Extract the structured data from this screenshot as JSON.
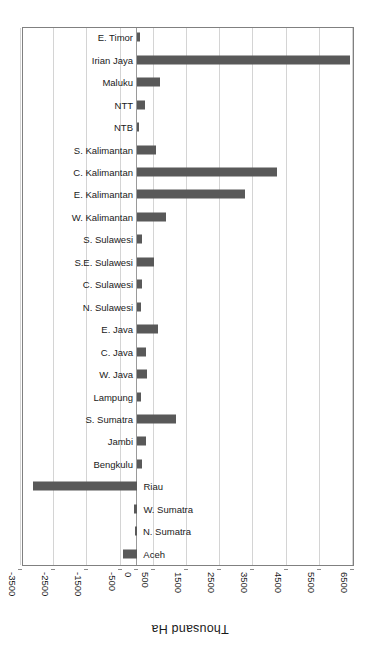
{
  "chart": {
    "type": "bar",
    "orientation": "horizontal",
    "rotated_180": true,
    "axis_title": "Thousand Ha"
  },
  "chart_data": {
    "type": "bar",
    "title": "",
    "subtitle": "",
    "xlabel": "Thousand Ha",
    "ylabel": "",
    "orientation": "horizontal",
    "grid": true,
    "legend": false,
    "xlim": [
      -3500,
      6500
    ],
    "xticks": [
      6500,
      5500,
      4500,
      3500,
      2500,
      1500,
      500,
      0,
      -500,
      -1500,
      -2500,
      -3500
    ],
    "xtick_labels": [
      "6500",
      "5500",
      "4500",
      "3500",
      "2500",
      "1500",
      "500",
      "0",
      "-500",
      "-1500",
      "-2500",
      "-3500"
    ],
    "categories": [
      "Aceh",
      "N. Sumatra",
      "W. Sumatra",
      "Riau",
      "Bengkulu",
      "Jambi",
      "S. Sumatra",
      "Lampung",
      "W. Java",
      "C. Java",
      "E. Java",
      "N. Sulawesi",
      "C. Sulawesi",
      "S.E. Sulawesi",
      "S. Sulawesi",
      "W. Kalimantan",
      "E. Kalimantan",
      "C. Kalimantan",
      "S. Kalimantan",
      "NTB",
      "NTT",
      "Maluku",
      "Irian Jaya",
      "E. Timor"
    ],
    "values": [
      -430,
      -60,
      -90,
      -3150,
      150,
      260,
      1180,
      100,
      290,
      280,
      620,
      110,
      140,
      500,
      130,
      860,
      3250,
      4200,
      560,
      60,
      250,
      680,
      6420,
      80
    ],
    "bar_color": "#595959",
    "grid_color": "#d4d4d4",
    "axis_color": "#808080"
  },
  "tick_geometry": {
    "zero_px": 212,
    "px_per_unit": 0.0332
  }
}
